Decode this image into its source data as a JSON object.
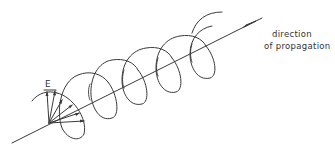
{
  "figure": {
    "labels": {
      "field_vector": "E",
      "direction_line1": "direction",
      "direction_line2": "of propagation"
    },
    "colors": {
      "stroke": "#3a3a3a",
      "background": "#ffffff"
    },
    "elements": {
      "axis": "propagation-axis",
      "helix_turns": 5,
      "field_vectors": 6
    }
  }
}
